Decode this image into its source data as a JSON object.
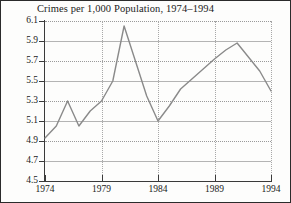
{
  "chart_data": {
    "type": "line",
    "title": "Crimes per 1,000 Population, 1974–1994",
    "xlabel": "",
    "ylabel": "",
    "xlim": [
      1974,
      1994
    ],
    "ylim": [
      4.5,
      6.1
    ],
    "grid": "horizontal-dotted",
    "legend": "none",
    "line_color": "#8a8a8a",
    "x": [
      1974,
      1975,
      1976,
      1977,
      1978,
      1979,
      1980,
      1981,
      1982,
      1983,
      1984,
      1985,
      1986,
      1987,
      1988,
      1989,
      1990,
      1991,
      1992,
      1993,
      1994
    ],
    "values": [
      4.93,
      5.05,
      5.3,
      5.05,
      5.2,
      5.3,
      5.5,
      6.05,
      5.7,
      5.35,
      5.1,
      5.25,
      5.42,
      5.52,
      5.62,
      5.72,
      5.81,
      5.88,
      5.74,
      5.6,
      5.4
    ],
    "series": [
      {
        "name": "Crimes per 1,000 Population",
        "values": [
          4.93,
          5.05,
          5.3,
          5.05,
          5.2,
          5.3,
          5.5,
          6.05,
          5.7,
          5.35,
          5.1,
          5.25,
          5.42,
          5.52,
          5.62,
          5.72,
          5.81,
          5.88,
          5.74,
          5.6,
          5.4
        ]
      }
    ],
    "y_ticks": [
      6.1,
      5.9,
      5.7,
      5.5,
      5.3,
      5.1,
      4.9,
      4.7,
      4.5
    ],
    "y_tick_labels": [
      "6.1",
      "5.9",
      "5.7",
      "5.5",
      "5.3",
      "5.1",
      "4.9",
      "4.7",
      "4.5"
    ],
    "x_ticks": [
      1974,
      1979,
      1984,
      1989,
      1994
    ],
    "x_tick_labels": [
      "1974",
      "1979",
      "1984",
      "1989",
      "1994"
    ]
  },
  "axes": {
    "axis_color": "#3a3a3a",
    "grid_color": "#9a9a9a"
  }
}
